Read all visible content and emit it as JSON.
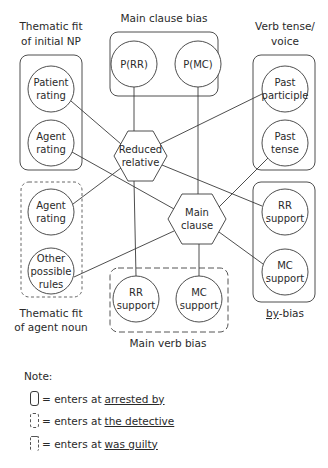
{
  "groups": {
    "thematic_fit_initial_np": {
      "title_line1": "Thematic fit",
      "title_line2": "of initial NP",
      "entry": "solid"
    },
    "main_clause_bias": {
      "title": "Main clause bias",
      "entry": "solid"
    },
    "verb_tense_voice": {
      "title_line1": "Verb tense/",
      "title_line2": "voice",
      "entry": "solid"
    },
    "thematic_fit_agent_noun": {
      "title_line1": "Thematic fit",
      "title_line2": "of agent noun",
      "entry": "dashed"
    },
    "main_verb_bias": {
      "title": "Main verb bias",
      "entry": "long-dashed"
    },
    "by_bias": {
      "title": "by-bias",
      "title_underlined_part": "by",
      "title_rest": "-bias",
      "entry": "solid"
    }
  },
  "nodes": {
    "patient_rating": {
      "line1": "Patient",
      "line2": "rating"
    },
    "agent_rating_np": {
      "line1": "Agent",
      "line2": "rating"
    },
    "agent_rating_noun": {
      "line1": "Agent",
      "line2": "rating"
    },
    "other_rules": {
      "line1": "Other",
      "line2": "possible",
      "line3": "rules"
    },
    "p_rr": {
      "line1": "P(RR)"
    },
    "p_mc": {
      "line1": "P(MC)"
    },
    "past_participle": {
      "line1": "Past",
      "line2": "participle"
    },
    "past_tense": {
      "line1": "Past",
      "line2": "tense"
    },
    "by_rr_support": {
      "line1": "RR",
      "line2": "support"
    },
    "by_mc_support": {
      "line1": "MC",
      "line2": "support"
    },
    "mv_rr_support": {
      "line1": "RR",
      "line2": "support"
    },
    "mv_mc_support": {
      "line1": "MC",
      "line2": "support"
    },
    "reduced_relative": {
      "line1": "Reduced",
      "line2": "relative"
    },
    "main_clause": {
      "line1": "Main",
      "line2": "clause"
    }
  },
  "edges": [
    {
      "from": "patient_rating",
      "to": "reduced_relative"
    },
    {
      "from": "agent_rating_np",
      "to": "main_clause"
    },
    {
      "from": "agent_rating_noun",
      "to": "reduced_relative"
    },
    {
      "from": "other_rules",
      "to": "main_clause"
    },
    {
      "from": "p_rr",
      "to": "reduced_relative"
    },
    {
      "from": "p_mc",
      "to": "main_clause"
    },
    {
      "from": "past_participle",
      "to": "reduced_relative"
    },
    {
      "from": "past_tense",
      "to": "main_clause"
    },
    {
      "from": "by_rr_support",
      "to": "reduced_relative"
    },
    {
      "from": "by_mc_support",
      "to": "main_clause"
    },
    {
      "from": "mv_rr_support",
      "to": "reduced_relative"
    },
    {
      "from": "mv_mc_support",
      "to": "main_clause"
    }
  ],
  "note": {
    "title": "Note:",
    "items": [
      {
        "symbol": "solid",
        "prefix": "= enters at",
        "words": "arrested  by"
      },
      {
        "symbol": "dashed",
        "prefix": "= enters at",
        "words": "the  detective"
      },
      {
        "symbol": "long-dashed",
        "prefix": "= enters at",
        "words": "was  guilty"
      }
    ]
  }
}
